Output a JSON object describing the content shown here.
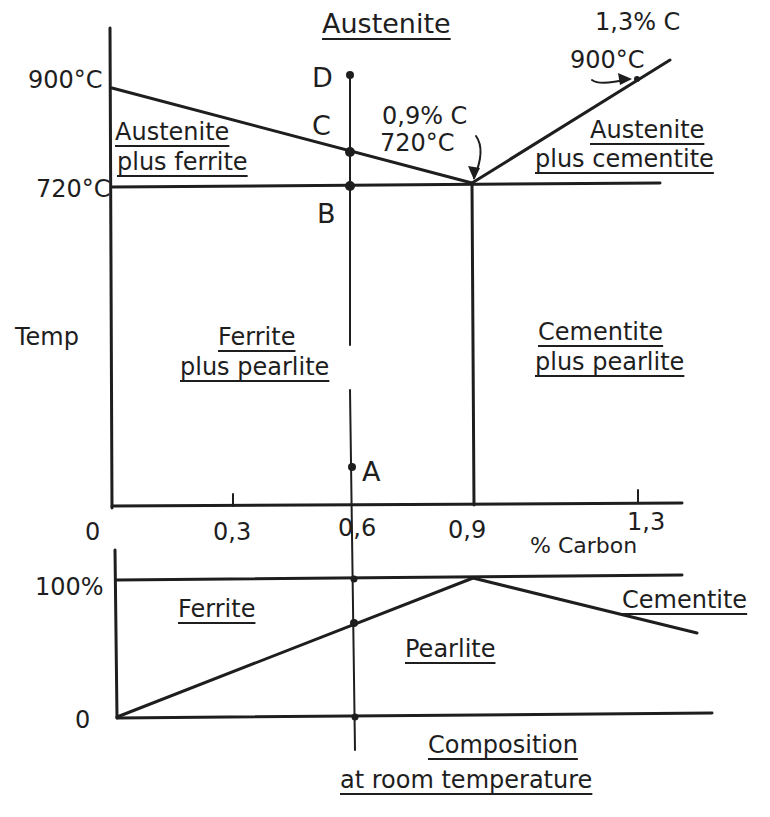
{
  "colors": {
    "ink": "#1e1e1e",
    "background": "#ffffff"
  },
  "top_diagram": {
    "region_labels": {
      "austenite": "Austenite",
      "austenite_ferrite_1": "Austenite",
      "austenite_ferrite_2": "plus ferrite",
      "austenite_cementite_1": "Austenite",
      "austenite_cementite_2": "plus cementite",
      "ferrite_pearlite_1": "Ferrite",
      "ferrite_pearlite_2": "plus pearlite",
      "cementite_pearlite_1": "Cementite",
      "cementite_pearlite_2": "plus pearlite"
    },
    "y_axis": {
      "label": "Temp",
      "ticks": [
        "900°C",
        "720°C"
      ]
    },
    "x_axis": {
      "label": "% Carbon",
      "ticks": [
        "0",
        "0,3",
        "0,6",
        "0,9",
        "1,3"
      ]
    },
    "points": {
      "A": "A",
      "B": "B",
      "C": "C",
      "D": "D"
    },
    "annotations": {
      "eutectoid_comp": "0,9% C",
      "eutectoid_temp": "720°C",
      "hyper_comp": "1,3% C",
      "hyper_temp": "900°C"
    }
  },
  "bottom_diagram": {
    "y_ticks": [
      "100%",
      "0"
    ],
    "labels": {
      "ferrite": "Ferrite",
      "pearlite": "Pearlite",
      "cementite": "Cementite",
      "title_1": "Composition",
      "title_2": "at room temperature"
    }
  }
}
